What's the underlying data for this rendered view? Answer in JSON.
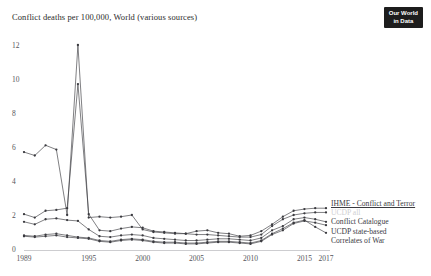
{
  "header": {
    "title": "Conflict deaths per 100,000, World (various sources)",
    "logo_line1": "Our World",
    "logo_line2": "in Data",
    "logo_bg": "#1d1d1d"
  },
  "chart_data": {
    "type": "line",
    "title": "Conflict deaths per 100,000, World (various sources)",
    "xlabel": "",
    "ylabel": "",
    "xlim": [
      1989,
      2017
    ],
    "ylim": [
      0,
      12.6
    ],
    "y_ticks": [
      0,
      2,
      4,
      6,
      8,
      10,
      12
    ],
    "x_ticks": [
      1989,
      1995,
      2000,
      2005,
      2010,
      2015,
      2017
    ],
    "grid": false,
    "legend_position": "right-inside",
    "line_color": "#3a3a3f",
    "dim_color": "#cfcfd2",
    "x": [
      1989,
      1990,
      1991,
      1992,
      1993,
      1994,
      1995,
      1996,
      1997,
      1998,
      1999,
      2000,
      2001,
      2002,
      2003,
      2004,
      2005,
      2006,
      2007,
      2008,
      2009,
      2010,
      2011,
      2012,
      2013,
      2014,
      2015,
      2016,
      2017
    ],
    "series": [
      {
        "name": "IHME - Conflict and Terror",
        "legend_label": "IHME - Conflict and Terror",
        "color": "#3a3a3f",
        "values": [
          2.05,
          1.85,
          2.25,
          2.3,
          2.4,
          9.7,
          2.05,
          1.1,
          1.05,
          1.2,
          1.3,
          1.25,
          1.05,
          1.0,
          0.95,
          0.9,
          0.85,
          0.85,
          0.8,
          0.75,
          0.7,
          0.7,
          0.85,
          1.35,
          1.75,
          2.0,
          2.1,
          2.15,
          2.15
        ]
      },
      {
        "name": "UCDP all",
        "legend_label": "UCDP all",
        "color": "#cfcfd2",
        "dim": true,
        "values": [
          1.6,
          1.45,
          1.75,
          1.8,
          1.7,
          1.65,
          1.15,
          0.75,
          0.7,
          0.8,
          0.85,
          0.8,
          0.65,
          0.6,
          0.55,
          0.5,
          0.5,
          0.55,
          0.6,
          0.6,
          0.55,
          0.5,
          0.65,
          1.1,
          1.35,
          1.75,
          1.85,
          1.75,
          1.6
        ]
      },
      {
        "name": "Conflict Catalogue",
        "legend_label": "Conflict Catalogue",
        "color": "#3a3a3f",
        "values": [
          5.7,
          5.5,
          6.1,
          5.85,
          2.0,
          12.0,
          1.85,
          1.9,
          1.85,
          1.9,
          2.0,
          1.15,
          1.0,
          0.95,
          0.9,
          0.9,
          1.05,
          1.1,
          0.95,
          0.9,
          0.75,
          0.8,
          1.05,
          1.45,
          1.9,
          2.25,
          2.35,
          2.4,
          2.4
        ]
      },
      {
        "name": "UCDP state-based",
        "legend_label": "UCDP state-based",
        "color": "#3a3a3f",
        "values": [
          0.75,
          0.7,
          0.75,
          0.8,
          0.7,
          0.65,
          0.6,
          0.45,
          0.4,
          0.5,
          0.55,
          0.5,
          0.4,
          0.35,
          0.35,
          0.3,
          0.3,
          0.35,
          0.4,
          0.4,
          0.35,
          0.3,
          0.45,
          0.85,
          1.1,
          1.5,
          1.65,
          1.55,
          1.4
        ]
      },
      {
        "name": "Correlates of War",
        "legend_label": "Correlates of War",
        "color": "#3a3a3f",
        "values": [
          0.8,
          0.75,
          0.85,
          0.9,
          0.8,
          0.7,
          0.65,
          0.5,
          0.45,
          0.55,
          0.6,
          0.55,
          0.45,
          0.4,
          0.4,
          0.35,
          0.35,
          0.4,
          0.45,
          0.45,
          0.4,
          0.35,
          0.5,
          0.9,
          1.2,
          1.55,
          1.7,
          1.3,
          0.95
        ]
      }
    ]
  }
}
